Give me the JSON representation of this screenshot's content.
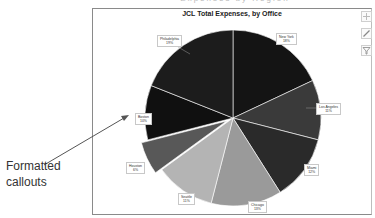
{
  "header": {
    "cropped_caption": "Expenses by Region"
  },
  "chart_tools": [
    {
      "name": "chart-elements",
      "icon": "plus-icon"
    },
    {
      "name": "chart-styles",
      "icon": "brush-icon"
    },
    {
      "name": "chart-filters",
      "icon": "filter-icon"
    }
  ],
  "annotation": {
    "line1": "Formatted",
    "line2": "callouts"
  },
  "chart_data": {
    "type": "pie",
    "title": "JCL Total Expenses, by Office",
    "categories": [
      "New York",
      "Los Angeles",
      "Miami",
      "Chicago",
      "Seattle",
      "Houston",
      "Boston",
      "Philadelphia"
    ],
    "values": [
      18,
      11,
      12,
      13,
      11,
      6,
      10,
      19
    ],
    "labels": [
      "18%",
      "11%",
      "12%",
      "13%",
      "11%",
      "6%",
      "10%",
      "19%"
    ],
    "colors": [
      "#141414",
      "#3a3a3a",
      "#2a2a2a",
      "#9a9a9a",
      "#b4b4b4",
      "#585858",
      "#101010",
      "#1c1c1c"
    ],
    "exploded": [
      "Houston"
    ],
    "data_labels": "callouts",
    "legend": "none",
    "start_angle_deg": 0,
    "direction": "clockwise"
  },
  "labels": {
    "new_york": {
      "name": "New York",
      "pct": "18%"
    },
    "los_angeles": {
      "name": "Los Angeles",
      "pct": "11%"
    },
    "miami": {
      "name": "Miami",
      "pct": "12%"
    },
    "chicago": {
      "name": "Chicago",
      "pct": "13%"
    },
    "seattle": {
      "name": "Seattle",
      "pct": "11%"
    },
    "houston": {
      "name": "Houston",
      "pct": "6%"
    },
    "boston": {
      "name": "Boston",
      "pct": "10%"
    },
    "philadelphia": {
      "name": "Philadelphia",
      "pct": "19%"
    }
  }
}
